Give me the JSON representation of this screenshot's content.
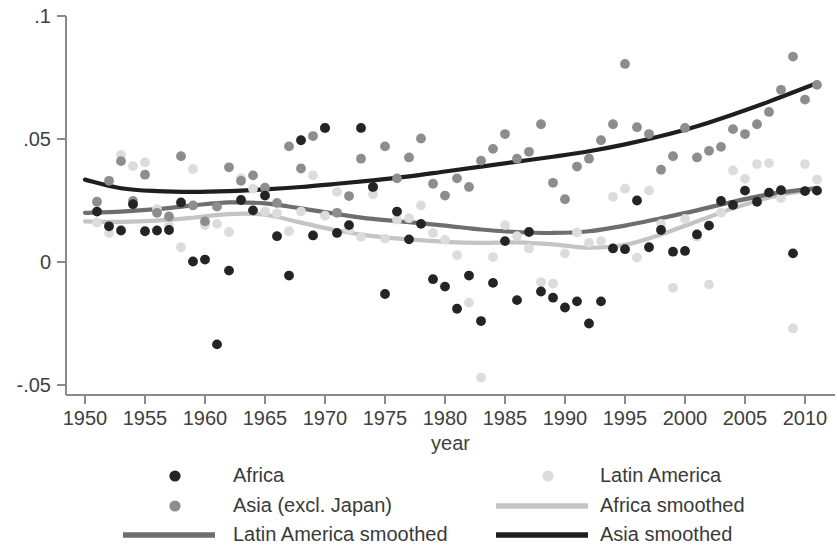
{
  "chart_data": {
    "type": "scatter",
    "title": "",
    "xlabel": "year",
    "ylabel": "",
    "xlim": [
      1950,
      2012
    ],
    "ylim": [
      -0.06,
      0.105
    ],
    "grid": false,
    "legend_position": "bottom",
    "xticks": [
      1950,
      1955,
      1960,
      1965,
      1970,
      1975,
      1980,
      1985,
      1990,
      1995,
      2000,
      2005,
      2010
    ],
    "xtick_labels": [
      "1950",
      "1955",
      "1960",
      "1965",
      "1970",
      "1975",
      "1980",
      "1985",
      "1990",
      "1995",
      "2000",
      "2005",
      "2010"
    ],
    "yticks": [
      -0.05,
      0,
      0.05,
      0.1
    ],
    "ytick_labels": [
      "-.05",
      "0",
      ".05",
      ".1"
    ],
    "colors": {
      "africa": "#242424",
      "asia": "#8d8d8d",
      "latin_america": "#dcdcdc",
      "africa_smoothed": "#c4c4c4",
      "latin_america_smoothed": "#6e6e6e",
      "asia_smoothed": "#1e1e1e",
      "axis": "#8a8a8a",
      "text": "#3a3a3a"
    },
    "series": [
      {
        "name": "Africa",
        "kind": "scatter",
        "color_key": "africa",
        "points": [
          [
            1951,
            0.0205
          ],
          [
            1952,
            0.0145
          ],
          [
            1953,
            0.0128
          ],
          [
            1954,
            0.0235
          ],
          [
            1955,
            0.0125
          ],
          [
            1956,
            0.0128
          ],
          [
            1957,
            0.013
          ],
          [
            1958,
            0.0242
          ],
          [
            1959,
            0.0002
          ],
          [
            1960,
            0.001
          ],
          [
            1961,
            -0.0335
          ],
          [
            1962,
            -0.0035
          ],
          [
            1963,
            0.0252
          ],
          [
            1964,
            0.021
          ],
          [
            1965,
            0.027
          ],
          [
            1966,
            0.0105
          ],
          [
            1967,
            -0.0055
          ],
          [
            1968,
            0.0495
          ],
          [
            1969,
            0.0108
          ],
          [
            1970,
            0.0545
          ],
          [
            1971,
            0.0118
          ],
          [
            1972,
            0.015
          ],
          [
            1973,
            0.0545
          ],
          [
            1974,
            0.0305
          ],
          [
            1975,
            -0.013
          ],
          [
            1976,
            0.0205
          ],
          [
            1977,
            0.0092
          ],
          [
            1978,
            0.0155
          ],
          [
            1979,
            -0.007
          ],
          [
            1980,
            -0.01
          ],
          [
            1981,
            -0.019
          ],
          [
            1982,
            -0.0055
          ],
          [
            1983,
            -0.024
          ],
          [
            1984,
            -0.0085
          ],
          [
            1985,
            0.0085
          ],
          [
            1986,
            -0.0155
          ],
          [
            1987,
            0.0122
          ],
          [
            1988,
            -0.012
          ],
          [
            1989,
            -0.0145
          ],
          [
            1990,
            -0.0185
          ],
          [
            1991,
            -0.016
          ],
          [
            1992,
            -0.025
          ],
          [
            1993,
            -0.016
          ],
          [
            1994,
            0.0055
          ],
          [
            1995,
            0.0052
          ],
          [
            1996,
            0.025
          ],
          [
            1997,
            0.006
          ],
          [
            1998,
            0.013
          ],
          [
            1999,
            0.0042
          ],
          [
            2000,
            0.0045
          ],
          [
            2001,
            0.0112
          ],
          [
            2002,
            0.0148
          ],
          [
            2003,
            0.0248
          ],
          [
            2004,
            0.0232
          ],
          [
            2005,
            0.029
          ],
          [
            2006,
            0.0245
          ],
          [
            2007,
            0.0282
          ],
          [
            2008,
            0.0292
          ],
          [
            2009,
            0.0035
          ],
          [
            2010,
            0.0288
          ],
          [
            2011,
            0.029
          ]
        ]
      },
      {
        "name": "Asia (excl. Japan)",
        "kind": "scatter",
        "color_key": "asia",
        "points": [
          [
            1951,
            0.0245
          ],
          [
            1952,
            0.033
          ],
          [
            1953,
            0.041
          ],
          [
            1954,
            0.0248
          ],
          [
            1955,
            0.0355
          ],
          [
            1956,
            0.02
          ],
          [
            1957,
            0.0185
          ],
          [
            1958,
            0.043
          ],
          [
            1959,
            0.023
          ],
          [
            1960,
            0.0165
          ],
          [
            1961,
            0.0225
          ],
          [
            1962,
            0.0385
          ],
          [
            1963,
            0.033
          ],
          [
            1964,
            0.0352
          ],
          [
            1965,
            0.0302
          ],
          [
            1966,
            0.024
          ],
          [
            1967,
            0.047
          ],
          [
            1968,
            0.038
          ],
          [
            1969,
            0.0512
          ],
          [
            1970,
            0.0545
          ],
          [
            1971,
            0.02
          ],
          [
            1972,
            0.0268
          ],
          [
            1973,
            0.042
          ],
          [
            1974,
            0.0305
          ],
          [
            1975,
            0.047
          ],
          [
            1976,
            0.034
          ],
          [
            1977,
            0.0425
          ],
          [
            1978,
            0.0502
          ],
          [
            1979,
            0.0318
          ],
          [
            1980,
            0.027
          ],
          [
            1981,
            0.034
          ],
          [
            1982,
            0.0305
          ],
          [
            1983,
            0.0412
          ],
          [
            1984,
            0.046
          ],
          [
            1985,
            0.052
          ],
          [
            1986,
            0.042
          ],
          [
            1987,
            0.0448
          ],
          [
            1988,
            0.056
          ],
          [
            1989,
            0.0322
          ],
          [
            1990,
            0.0255
          ],
          [
            1991,
            0.0388
          ],
          [
            1992,
            0.042
          ],
          [
            1993,
            0.0495
          ],
          [
            1994,
            0.056
          ],
          [
            1995,
            0.0805
          ],
          [
            1996,
            0.0548
          ],
          [
            1997,
            0.052
          ],
          [
            1998,
            0.0375
          ],
          [
            1999,
            0.043
          ],
          [
            2000,
            0.0545
          ],
          [
            2001,
            0.0425
          ],
          [
            2002,
            0.0452
          ],
          [
            2003,
            0.0468
          ],
          [
            2004,
            0.054
          ],
          [
            2005,
            0.052
          ],
          [
            2006,
            0.056
          ],
          [
            2007,
            0.061
          ],
          [
            2008,
            0.07
          ],
          [
            2009,
            0.0835
          ],
          [
            2010,
            0.066
          ],
          [
            2011,
            0.072
          ]
        ]
      },
      {
        "name": "Latin America",
        "kind": "scatter",
        "color_key": "latin_america",
        "points": [
          [
            1951,
            0.016
          ],
          [
            1952,
            0.0118
          ],
          [
            1953,
            0.0435
          ],
          [
            1954,
            0.039
          ],
          [
            1955,
            0.0405
          ],
          [
            1956,
            0.0215
          ],
          [
            1957,
            0.0148
          ],
          [
            1958,
            0.006
          ],
          [
            1959,
            0.0378
          ],
          [
            1960,
            0.015
          ],
          [
            1961,
            0.0155
          ],
          [
            1962,
            0.0122
          ],
          [
            1963,
            0.034
          ],
          [
            1964,
            0.0298
          ],
          [
            1965,
            0.0205
          ],
          [
            1966,
            0.0198
          ],
          [
            1967,
            0.0125
          ],
          [
            1968,
            0.0205
          ],
          [
            1969,
            0.0352
          ],
          [
            1970,
            0.0188
          ],
          [
            1971,
            0.0285
          ],
          [
            1972,
            0.013
          ],
          [
            1973,
            0.0102
          ],
          [
            1974,
            0.0275
          ],
          [
            1975,
            0.0095
          ],
          [
            1976,
            0.0172
          ],
          [
            1977,
            0.0178
          ],
          [
            1978,
            0.023
          ],
          [
            1979,
            0.0118
          ],
          [
            1980,
            0.009
          ],
          [
            1981,
            0.0028
          ],
          [
            1982,
            -0.0165
          ],
          [
            1983,
            -0.047
          ],
          [
            1984,
            0.002
          ],
          [
            1985,
            0.015
          ],
          [
            1986,
            0.0105
          ],
          [
            1987,
            0.0055
          ],
          [
            1988,
            -0.0082
          ],
          [
            1989,
            -0.0088
          ],
          [
            1990,
            0.0035
          ],
          [
            1991,
            0.012
          ],
          [
            1992,
            0.0078
          ],
          [
            1993,
            0.0085
          ],
          [
            1994,
            0.0265
          ],
          [
            1995,
            0.0298
          ],
          [
            1996,
            0.0018
          ],
          [
            1997,
            0.029
          ],
          [
            1998,
            0.0155
          ],
          [
            1999,
            -0.0105
          ],
          [
            2000,
            0.0175
          ],
          [
            2001,
            0.0102
          ],
          [
            2002,
            -0.0092
          ],
          [
            2003,
            0.02
          ],
          [
            2004,
            0.0372
          ],
          [
            2005,
            0.0338
          ],
          [
            2006,
            0.0398
          ],
          [
            2007,
            0.0402
          ],
          [
            2008,
            0.026
          ],
          [
            2009,
            -0.027
          ],
          [
            2010,
            0.0398
          ],
          [
            2011,
            0.0335
          ]
        ]
      },
      {
        "name": "Africa smoothed",
        "kind": "line",
        "color_key": "africa_smoothed",
        "points": [
          [
            1950,
            0.0165
          ],
          [
            1953,
            0.0163
          ],
          [
            1956,
            0.0168
          ],
          [
            1959,
            0.018
          ],
          [
            1962,
            0.0195
          ],
          [
            1965,
            0.0192
          ],
          [
            1968,
            0.016
          ],
          [
            1971,
            0.0128
          ],
          [
            1974,
            0.0105
          ],
          [
            1977,
            0.0092
          ],
          [
            1980,
            0.0082
          ],
          [
            1983,
            0.0078
          ],
          [
            1986,
            0.008
          ],
          [
            1989,
            0.0072
          ],
          [
            1992,
            0.0058
          ],
          [
            1995,
            0.007
          ],
          [
            1998,
            0.0112
          ],
          [
            2001,
            0.0165
          ],
          [
            2004,
            0.0218
          ],
          [
            2007,
            0.0262
          ],
          [
            2010,
            0.029
          ],
          [
            2011,
            0.0298
          ]
        ]
      },
      {
        "name": "Latin America smoothed",
        "kind": "line",
        "color_key": "latin_america_smoothed",
        "points": [
          [
            1950,
            0.02
          ],
          [
            1953,
            0.0205
          ],
          [
            1956,
            0.0215
          ],
          [
            1959,
            0.023
          ],
          [
            1962,
            0.0242
          ],
          [
            1965,
            0.0238
          ],
          [
            1968,
            0.0218
          ],
          [
            1971,
            0.0195
          ],
          [
            1974,
            0.0175
          ],
          [
            1977,
            0.0162
          ],
          [
            1980,
            0.0148
          ],
          [
            1983,
            0.0132
          ],
          [
            1986,
            0.0122
          ],
          [
            1989,
            0.0118
          ],
          [
            1992,
            0.0125
          ],
          [
            1995,
            0.0148
          ],
          [
            1998,
            0.0178
          ],
          [
            2001,
            0.021
          ],
          [
            2004,
            0.0245
          ],
          [
            2007,
            0.0275
          ],
          [
            2010,
            0.0295
          ],
          [
            2011,
            0.03
          ]
        ]
      },
      {
        "name": "Asia smoothed",
        "kind": "line",
        "color_key": "asia_smoothed",
        "points": [
          [
            1950,
            0.0335
          ],
          [
            1953,
            0.03
          ],
          [
            1956,
            0.0288
          ],
          [
            1959,
            0.0285
          ],
          [
            1962,
            0.0288
          ],
          [
            1965,
            0.0295
          ],
          [
            1968,
            0.0305
          ],
          [
            1971,
            0.0318
          ],
          [
            1974,
            0.0332
          ],
          [
            1977,
            0.0348
          ],
          [
            1980,
            0.0368
          ],
          [
            1983,
            0.0388
          ],
          [
            1986,
            0.0408
          ],
          [
            1989,
            0.0428
          ],
          [
            1992,
            0.045
          ],
          [
            1995,
            0.0478
          ],
          [
            1998,
            0.0512
          ],
          [
            2001,
            0.0552
          ],
          [
            2004,
            0.06
          ],
          [
            2007,
            0.0652
          ],
          [
            2010,
            0.0708
          ],
          [
            2011,
            0.0728
          ]
        ]
      }
    ]
  },
  "legend": {
    "entries": [
      {
        "label": "Africa",
        "marker": "dot",
        "color_key": "africa"
      },
      {
        "label": "Latin America",
        "marker": "dot",
        "color_key": "latin_america"
      },
      {
        "label": "Asia (excl. Japan)",
        "marker": "dot",
        "color_key": "asia"
      },
      {
        "label": "Africa smoothed",
        "marker": "line",
        "color_key": "africa_smoothed"
      },
      {
        "label": "Latin America smoothed",
        "marker": "line",
        "color_key": "latin_america_smoothed"
      },
      {
        "label": "Asia smoothed",
        "marker": "line",
        "color_key": "asia_smoothed"
      }
    ]
  }
}
